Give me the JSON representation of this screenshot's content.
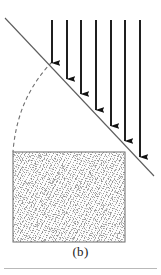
{
  "figure": {
    "caption": "(b)",
    "domain_hint": "soil-mechanics-slope-diagram",
    "colors": {
      "ink": "#141414",
      "line": "#5d5d5d",
      "dashed": "#6f6f6f",
      "stipple": "#9a9a9a",
      "rule": "#b9b9b9",
      "background": "#ffffff"
    },
    "slope_line": {
      "name": "ground-surface-line",
      "x1": 5,
      "y1": 18,
      "x2": 154,
      "y2": 176,
      "stroke_width": 1.1
    },
    "failure_arc": {
      "name": "failure-surface-arc",
      "start_x": 52,
      "start_y": 62,
      "end_x": 13,
      "end_y": 152,
      "control_x": 17,
      "control_y": 98,
      "dash": "4 3",
      "stroke_width": 1.1
    },
    "soil_block": {
      "name": "soil-mass-block",
      "x": 13,
      "y": 152,
      "width": 112,
      "height": 90,
      "fill": "#fbfbfb",
      "stroke": "#6b6b6b"
    },
    "arrows": {
      "count": 7,
      "top_y": 20,
      "shaft_width": 1.9,
      "head_width": 6,
      "head_length": 9,
      "items": [
        {
          "label": "load-arrow-1",
          "x": 52,
          "tip_y": 63
        },
        {
          "label": "load-arrow-2",
          "x": 67,
          "tip_y": 79
        },
        {
          "label": "load-arrow-3",
          "x": 81,
          "tip_y": 94
        },
        {
          "label": "load-arrow-4",
          "x": 96,
          "tip_y": 110
        },
        {
          "label": "load-arrow-5",
          "x": 111,
          "tip_y": 126
        },
        {
          "label": "load-arrow-6",
          "x": 125,
          "tip_y": 141
        },
        {
          "label": "load-arrow-7",
          "x": 140,
          "tip_y": 157
        }
      ]
    },
    "bottom_rule": {
      "name": "page-divider-rule"
    }
  }
}
